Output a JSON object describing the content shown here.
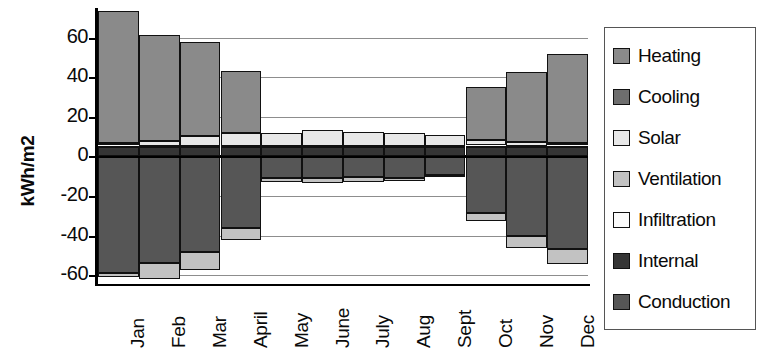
{
  "chart_data": {
    "type": "bar",
    "title": "",
    "subtitle": "",
    "stacked": true,
    "xlabel": "",
    "ylabel": "kWh/m2",
    "ylim": [
      -65,
      75
    ],
    "yticks": [
      60,
      40,
      20,
      0,
      -20,
      -40,
      -60
    ],
    "ytick_labels": [
      "60",
      "40",
      "20",
      "0",
      "-20",
      "-40",
      "-60"
    ],
    "grid": true,
    "grid_axis": "y",
    "legend_position": "right",
    "categories": [
      "Jan",
      "Feb",
      "Mar",
      "April",
      "May",
      "June",
      "July",
      "Aug",
      "Sept",
      "Oct",
      "Nov",
      "Dec"
    ],
    "series": [
      {
        "name": "Heating",
        "color": "#8a8a8a",
        "values": [
          66.5,
          53.5,
          47.5,
          31.0,
          0.0,
          0.0,
          0.0,
          0.0,
          0.0,
          26.5,
          35.0,
          45.0
        ]
      },
      {
        "name": "Cooling",
        "color": "#6e6e6e",
        "values": [
          0.0,
          0.0,
          0.0,
          0.0,
          0.0,
          0.0,
          0.0,
          0.0,
          0.0,
          0.0,
          0.0,
          0.0
        ]
      },
      {
        "name": "Solar",
        "color": "#e8e8e8",
        "values": [
          1.5,
          2.5,
          5.0,
          6.5,
          6.5,
          8.0,
          7.0,
          6.5,
          5.5,
          3.0,
          2.0,
          1.5
        ]
      },
      {
        "name": "Ventilation",
        "color": "#c2c2c2",
        "values": [
          -2.0,
          -8.0,
          -9.0,
          -6.5,
          -2.0,
          -2.5,
          -2.5,
          -1.5,
          -0.5,
          -4.0,
          -6.5,
          -7.5
        ]
      },
      {
        "name": "Infiltration",
        "color": "#fbfbfb",
        "values": [
          1.0,
          1.0,
          1.0,
          1.0,
          1.0,
          1.0,
          1.0,
          1.0,
          1.0,
          1.0,
          1.0,
          1.0
        ]
      },
      {
        "name": "Internal",
        "color": "#353535",
        "values": [
          4.5,
          4.5,
          4.5,
          4.5,
          4.5,
          4.5,
          4.5,
          4.5,
          4.5,
          4.5,
          4.5,
          4.5
        ]
      },
      {
        "name": "Conduction",
        "color": "#565656",
        "values": [
          -59.0,
          -54.0,
          -48.5,
          -36.0,
          -11.0,
          -11.0,
          -10.5,
          -11.0,
          -9.5,
          -28.5,
          -40.0,
          -47.0
        ]
      }
    ]
  },
  "legend": {
    "items": [
      {
        "label": "Heating"
      },
      {
        "label": "Cooling"
      },
      {
        "label": "Solar"
      },
      {
        "label": "Ventilation"
      },
      {
        "label": "Infiltration"
      },
      {
        "label": "Internal"
      },
      {
        "label": "Conduction"
      }
    ]
  }
}
